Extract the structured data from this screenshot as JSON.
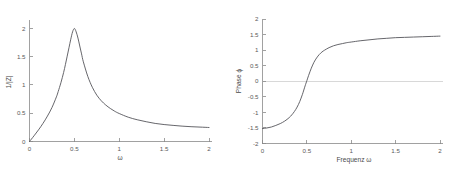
{
  "figure": {
    "background_color": "#ffffff",
    "curve_color": "#55555a",
    "axis_color": "#8a8a8a",
    "zero_line_color": "#d8d8d8",
    "label_color": "#5a5a5a"
  },
  "chart_data": [
    {
      "type": "line",
      "name": "amplitude-response",
      "title": "",
      "xlabel": "ω",
      "ylabel": "1/|Z|",
      "xlim": [
        0,
        2
      ],
      "ylim": [
        0,
        2.15
      ],
      "grid": false,
      "legend": null,
      "xticks": [
        0,
        0.5,
        1,
        1.5,
        2
      ],
      "xticklabels": [
        "0",
        "0.5",
        "1",
        "1.5",
        "2"
      ],
      "yticks": [
        0,
        0.5,
        1,
        1.5,
        2
      ],
      "yticklabels": [
        "0",
        "0.5",
        "1",
        "1.5",
        "2"
      ],
      "peak": {
        "x": 0.5,
        "y": 2.0
      },
      "x": [
        0,
        0.05,
        0.1,
        0.15,
        0.2,
        0.25,
        0.3,
        0.32,
        0.35,
        0.38,
        0.4,
        0.42,
        0.44,
        0.46,
        0.48,
        0.5,
        0.52,
        0.54,
        0.56,
        0.58,
        0.6,
        0.65,
        0.7,
        0.75,
        0.8,
        0.85,
        0.9,
        0.95,
        1.0,
        1.1,
        1.2,
        1.3,
        1.4,
        1.5,
        1.6,
        1.7,
        1.8,
        1.9,
        2.0
      ],
      "y": [
        0.0,
        0.1,
        0.205,
        0.32,
        0.45,
        0.6,
        0.79,
        0.885,
        1.04,
        1.22,
        1.36,
        1.51,
        1.66,
        1.81,
        1.94,
        2.0,
        1.94,
        1.83,
        1.69,
        1.55,
        1.41,
        1.15,
        0.96,
        0.82,
        0.72,
        0.645,
        0.585,
        0.535,
        0.495,
        0.43,
        0.385,
        0.35,
        0.32,
        0.3,
        0.285,
        0.272,
        0.262,
        0.255,
        0.248
      ]
    },
    {
      "type": "line",
      "name": "phase-response",
      "title": "",
      "xlabel": "Frequenz ω",
      "ylabel": "Phase ϕ",
      "xlim": [
        0,
        2
      ],
      "ylim": [
        -2,
        2
      ],
      "grid": false,
      "legend": null,
      "zero_reference_line": 0,
      "xticks": [
        0,
        0.5,
        1,
        1.5,
        2
      ],
      "xticklabels": [
        "0",
        "0.5",
        "1",
        "1.5",
        "2"
      ],
      "yticks": [
        -2,
        -1.5,
        -1,
        -0.5,
        0,
        0.5,
        1,
        1.5,
        2
      ],
      "yticklabels": [
        "-2",
        "-1.5",
        "-1",
        "-0.5",
        "0",
        "0.5",
        "1",
        "1.5",
        "2"
      ],
      "x": [
        0,
        0.05,
        0.1,
        0.15,
        0.2,
        0.25,
        0.3,
        0.33,
        0.36,
        0.39,
        0.42,
        0.45,
        0.48,
        0.5,
        0.52,
        0.55,
        0.58,
        0.61,
        0.64,
        0.67,
        0.7,
        0.75,
        0.8,
        0.85,
        0.9,
        0.95,
        1.0,
        1.1,
        1.2,
        1.3,
        1.4,
        1.5,
        1.6,
        1.7,
        1.8,
        1.9,
        2.0
      ],
      "y": [
        -1.52,
        -1.5,
        -1.47,
        -1.42,
        -1.36,
        -1.28,
        -1.17,
        -1.08,
        -0.97,
        -0.83,
        -0.65,
        -0.42,
        -0.15,
        0.02,
        0.19,
        0.42,
        0.61,
        0.75,
        0.86,
        0.94,
        1.0,
        1.08,
        1.14,
        1.18,
        1.21,
        1.24,
        1.26,
        1.3,
        1.33,
        1.36,
        1.38,
        1.4,
        1.41,
        1.42,
        1.43,
        1.44,
        1.45
      ]
    }
  ]
}
